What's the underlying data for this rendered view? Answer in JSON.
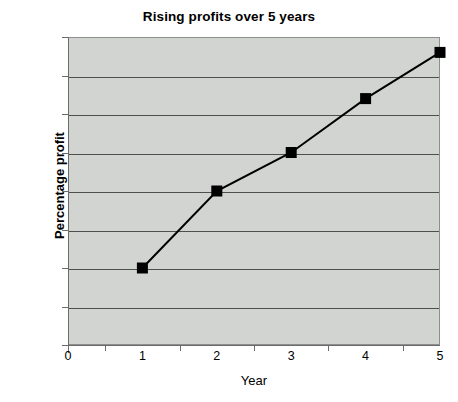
{
  "chart_data": {
    "type": "line",
    "title": "Rising profits over 5 years",
    "xlabel": "Year",
    "ylabel": "Percentage profit",
    "x": [
      1,
      2,
      3,
      4,
      5
    ],
    "values": [
      0.1,
      0.2,
      0.25,
      0.32,
      0.38
    ],
    "series": [
      {
        "name": "Percentage profit",
        "values": [
          0.1,
          0.2,
          0.25,
          0.32,
          0.38
        ]
      }
    ],
    "xlim": [
      0,
      5
    ],
    "ylim": [
      0,
      0.4
    ],
    "x_tick_labels": [
      "0",
      "1",
      "2",
      "3",
      "4",
      "5"
    ],
    "y_tick_labels": [
      "0",
      "0.05",
      "0.1",
      "0.15",
      "0.2",
      "0.25",
      "0.3",
      "0.35",
      "0.4"
    ],
    "y_tick_values": [
      0,
      0.05,
      0.1,
      0.15,
      0.2,
      0.25,
      0.3,
      0.35,
      0.4
    ],
    "grid": "horizontal",
    "legend": "none",
    "marker": "filled-square",
    "line_color": "#000000",
    "marker_color": "#000000",
    "plot_background": "#d2d4d2",
    "gridline_color": "#4d4f4d",
    "page_background": "#ffffff"
  },
  "artifact": {
    "top_text": "…  …"
  }
}
